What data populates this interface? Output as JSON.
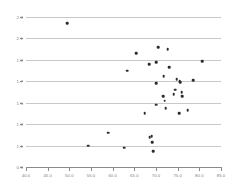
{
  "chart_data": {
    "type": "scatter",
    "title": "",
    "xlabel": "",
    "ylabel": "",
    "xlim": [
      40.0,
      85.0
    ],
    "ylim": [
      0.9,
      2.3
    ],
    "grid": true,
    "legend": null,
    "xticks": [
      "40.0",
      "45.0",
      "50.0",
      "55.0",
      "60.0",
      "65.0",
      "70.0",
      "75.0",
      "80.0",
      "85.0"
    ],
    "xtick_values": [
      40.0,
      45.0,
      50.0,
      55.0,
      60.0,
      65.0,
      70.0,
      75.0,
      80.0,
      85.0
    ],
    "yticks": [
      "0.9",
      "1.1",
      "1.3",
      "1.5",
      "1.7",
      "1.9",
      "2.1",
      "2.3"
    ],
    "ytick_values": [
      0.9,
      1.1,
      1.3,
      1.5,
      1.7,
      1.9,
      2.1,
      2.3
    ],
    "gridline_values": [
      1.1,
      1.3,
      1.5,
      1.7,
      1.9,
      2.1,
      2.3
    ],
    "marker_color": "#2b2b2b",
    "gridline_color": "#c9c9c9",
    "axis_color": "#8a8a8a",
    "background_color": "#ffffff",
    "points": [
      {
        "x": 49.5,
        "y": 2.24
      },
      {
        "x": 54.4,
        "y": 1.1
      },
      {
        "x": 59.0,
        "y": 1.22
      },
      {
        "x": 62.6,
        "y": 1.08
      },
      {
        "x": 63.3,
        "y": 1.8
      },
      {
        "x": 65.4,
        "y": 1.96
      },
      {
        "x": 67.4,
        "y": 1.4
      },
      {
        "x": 68.4,
        "y": 1.86
      },
      {
        "x": 68.5,
        "y": 1.18
      },
      {
        "x": 69.0,
        "y": 1.19
      },
      {
        "x": 69.1,
        "y": 1.13
      },
      {
        "x": 69.3,
        "y": 1.05
      },
      {
        "x": 70.0,
        "y": 1.68
      },
      {
        "x": 70.1,
        "y": 1.88
      },
      {
        "x": 70.1,
        "y": 1.48
      },
      {
        "x": 70.5,
        "y": 2.02
      },
      {
        "x": 71.6,
        "y": 1.56
      },
      {
        "x": 71.8,
        "y": 1.75
      },
      {
        "x": 72.0,
        "y": 1.52
      },
      {
        "x": 72.2,
        "y": 1.45
      },
      {
        "x": 72.7,
        "y": 2.0
      },
      {
        "x": 73.0,
        "y": 1.83
      },
      {
        "x": 74.1,
        "y": 1.58
      },
      {
        "x": 74.4,
        "y": 1.62
      },
      {
        "x": 74.8,
        "y": 1.72
      },
      {
        "x": 75.3,
        "y": 1.4
      },
      {
        "x": 75.5,
        "y": 1.7
      },
      {
        "x": 75.6,
        "y": 1.69
      },
      {
        "x": 75.9,
        "y": 1.6
      },
      {
        "x": 76.0,
        "y": 1.56
      },
      {
        "x": 77.3,
        "y": 1.43
      },
      {
        "x": 78.6,
        "y": 1.71
      },
      {
        "x": 80.6,
        "y": 1.89
      }
    ]
  }
}
